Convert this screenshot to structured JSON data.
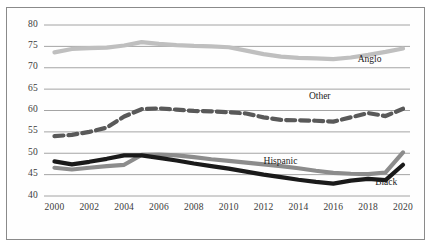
{
  "chart_data": {
    "type": "line",
    "title": "",
    "subtitle": "",
    "xlabel": "",
    "ylabel": "",
    "xlim": [
      1999.4,
      2020.4
    ],
    "ylim": [
      40,
      80
    ],
    "grid": true,
    "grid_axis": "y",
    "legend_position": "inline-right-of-series",
    "x": [
      2000,
      2001,
      2002,
      2003,
      2004,
      2005,
      2006,
      2007,
      2008,
      2009,
      2010,
      2011,
      2012,
      2013,
      2014,
      2015,
      2016,
      2017,
      2018,
      2019,
      2020
    ],
    "xticks": [
      2000,
      2002,
      2004,
      2006,
      2008,
      2010,
      2012,
      2014,
      2016,
      2018,
      2020
    ],
    "xtick_labels": [
      "2000",
      "2002",
      "2004",
      "2006",
      "2008",
      "2010",
      "2012",
      "2014",
      "2016",
      "2018",
      "2020"
    ],
    "yticks": [
      40,
      45,
      50,
      55,
      60,
      65,
      70,
      75,
      80
    ],
    "ytick_labels": [
      "40",
      "45",
      "50",
      "55",
      "60",
      "65",
      "70",
      "75",
      "80"
    ],
    "series": [
      {
        "name": "Anglo",
        "label": "Anglo",
        "color": "#bfbfbf",
        "style": "solid",
        "width": 4.2,
        "label_x": 2017.4,
        "label_y": 71.6,
        "values": [
          73.6,
          74.4,
          74.6,
          74.7,
          75.2,
          76.0,
          75.6,
          75.3,
          75.1,
          75.0,
          74.8,
          74.0,
          73.2,
          72.6,
          72.3,
          72.2,
          72.0,
          72.4,
          73.0,
          73.7,
          74.5
        ]
      },
      {
        "name": "Other",
        "label": "Other",
        "color": "#595959",
        "style": "dashed",
        "width": 4.2,
        "label_x": 2014.6,
        "label_y": 63.1,
        "values": [
          54.0,
          54.3,
          55.0,
          56.0,
          58.6,
          60.3,
          60.5,
          60.2,
          59.9,
          59.8,
          59.6,
          59.3,
          58.4,
          57.8,
          57.7,
          57.6,
          57.4,
          58.4,
          59.4,
          58.7,
          60.4
        ]
      },
      {
        "name": "Hispanic",
        "label": "Hispanic",
        "color": "#8c8c8c",
        "style": "solid",
        "width": 4.2,
        "label_x": 2012.0,
        "label_y": 47.9,
        "values": [
          46.6,
          46.2,
          46.6,
          47.0,
          47.3,
          49.6,
          49.7,
          49.5,
          49.1,
          48.6,
          48.2,
          47.8,
          47.4,
          47.0,
          46.5,
          45.9,
          45.4,
          45.2,
          45.1,
          45.5,
          50.2
        ]
      },
      {
        "name": "Black",
        "label": "Black",
        "color": "#1a1a1a",
        "style": "solid",
        "width": 4.2,
        "label_x": 2018.4,
        "label_y": 43.0,
        "values": [
          48.1,
          47.4,
          48.0,
          48.7,
          49.5,
          49.5,
          48.9,
          48.3,
          47.6,
          47.0,
          46.4,
          45.7,
          45.0,
          44.4,
          43.8,
          43.3,
          42.9,
          43.6,
          44.0,
          43.7,
          47.3
        ]
      }
    ]
  },
  "axis": {
    "y_labels": [
      "80",
      "75",
      "70",
      "65",
      "60",
      "55",
      "50",
      "45",
      "40"
    ],
    "x_labels": [
      "2000",
      "2002",
      "2004",
      "2006",
      "2008",
      "2010",
      "2012",
      "2014",
      "2016",
      "2018",
      "2020"
    ]
  },
  "colors": {
    "anglo": "#bfbfbf",
    "other": "#595959",
    "hispanic": "#8c8c8c",
    "black": "#1a1a1a",
    "gridline": "#9a9a9a",
    "frame": "#8a8a8a",
    "background": "#ffffff"
  }
}
